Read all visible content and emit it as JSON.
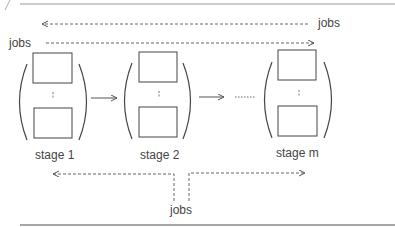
{
  "diagram": {
    "top_return_label": "jobs",
    "top_input_label": "jobs",
    "bottom_label": "jobs",
    "stages": [
      {
        "label": "stage 1"
      },
      {
        "label": "stage 2"
      },
      {
        "label": "stage m"
      }
    ],
    "ellipsis_between_stages": "......",
    "colors": {
      "line": "#555555",
      "dashed": "#666666",
      "frame": "#888888"
    }
  }
}
